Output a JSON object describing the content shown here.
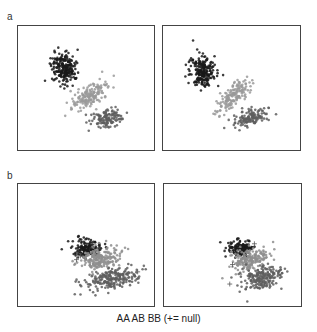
{
  "chart_data": {
    "type": "scatter",
    "title": "",
    "legend_text": "AA AB BB (+= null)",
    "legend_position": "bottom",
    "grid": false,
    "rows": [
      {
        "label": "a",
        "panels": [
          {
            "id": "a-left",
            "clusters": [
              {
                "name": "AA",
                "color": "#1a1a1a",
                "cx": 0.34,
                "cy": 0.34,
                "sx": 0.045,
                "sy": 0.065,
                "n": 220,
                "rot": -10
              },
              {
                "name": "AB",
                "color": "#9a9a9a",
                "cx": 0.53,
                "cy": 0.56,
                "sx": 0.085,
                "sy": 0.035,
                "n": 160,
                "rot": -40
              },
              {
                "name": "BB",
                "color": "#5e5e5e",
                "cx": 0.66,
                "cy": 0.74,
                "sx": 0.06,
                "sy": 0.035,
                "n": 130,
                "rot": -25
              }
            ],
            "nulls": []
          },
          {
            "id": "a-right",
            "clusters": [
              {
                "name": "AA",
                "color": "#1a1a1a",
                "cx": 0.29,
                "cy": 0.37,
                "sx": 0.045,
                "sy": 0.065,
                "n": 220,
                "rot": -10
              },
              {
                "name": "AB",
                "color": "#9a9a9a",
                "cx": 0.5,
                "cy": 0.57,
                "sx": 0.085,
                "sy": 0.035,
                "n": 160,
                "rot": -45
              },
              {
                "name": "BB",
                "color": "#5e5e5e",
                "cx": 0.64,
                "cy": 0.74,
                "sx": 0.07,
                "sy": 0.03,
                "n": 130,
                "rot": -20
              }
            ],
            "nulls": []
          }
        ]
      },
      {
        "label": "b",
        "panels": [
          {
            "id": "b-left",
            "clusters": [
              {
                "name": "AA",
                "color": "#1a1a1a",
                "cx": 0.51,
                "cy": 0.53,
                "sx": 0.05,
                "sy": 0.035,
                "n": 150,
                "rot": 0
              },
              {
                "name": "AB",
                "color": "#8e8e8e",
                "cx": 0.6,
                "cy": 0.61,
                "sx": 0.075,
                "sy": 0.05,
                "n": 200,
                "rot": -15
              },
              {
                "name": "BB",
                "color": "#5e5e5e",
                "cx": 0.68,
                "cy": 0.78,
                "sx": 0.095,
                "sy": 0.04,
                "n": 220,
                "rot": -15
              }
            ],
            "nulls": [
              [
                0.43,
                0.62
              ],
              [
                0.88,
                0.72
              ],
              [
                0.46,
                0.59
              ]
            ]
          },
          {
            "id": "b-right",
            "clusters": [
              {
                "name": "AA",
                "color": "#1a1a1a",
                "cx": 0.56,
                "cy": 0.53,
                "sx": 0.045,
                "sy": 0.035,
                "n": 140,
                "rot": 0
              },
              {
                "name": "AB",
                "color": "#8e8e8e",
                "cx": 0.63,
                "cy": 0.62,
                "sx": 0.07,
                "sy": 0.045,
                "n": 190,
                "rot": -15
              },
              {
                "name": "BB",
                "color": "#5e5e5e",
                "cx": 0.71,
                "cy": 0.77,
                "sx": 0.075,
                "sy": 0.045,
                "n": 200,
                "rot": -15
              }
            ],
            "nulls": [
              [
                0.5,
                0.66
              ],
              [
                0.48,
                0.82
              ],
              [
                0.66,
                0.49
              ]
            ]
          }
        ]
      }
    ]
  },
  "labels": {
    "row_a": "a",
    "row_b": "b",
    "legend": "AA AB BB (+= null)"
  }
}
